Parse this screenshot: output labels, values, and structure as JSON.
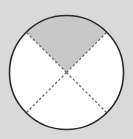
{
  "diagram": {
    "type": "fraction-circle",
    "total_parts": 4,
    "shaded_parts": 1,
    "shaded_part": "top",
    "colors": {
      "background": "#d9d9d9",
      "circle_fill": "#ffffff",
      "shaded_fill": "#c8c8c8",
      "outline": "#2a2a2a",
      "divider": "#6a6a6a"
    }
  }
}
